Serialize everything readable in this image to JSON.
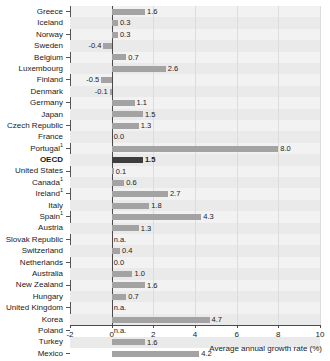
{
  "chart_data": {
    "type": "bar",
    "orientation": "horizontal",
    "title": "",
    "xlabel": "Average annual growth rate (%)",
    "ylabel": "",
    "xlim": [
      -2,
      10
    ],
    "xticks": [
      -2,
      0,
      2,
      4,
      6,
      8,
      10
    ],
    "xtick_labels": [
      "-2",
      "0",
      "2",
      "4",
      "6",
      "8",
      "10"
    ],
    "grid": true,
    "legend": false,
    "na_text": "n.a.",
    "categories": [
      "Greece",
      "Iceland",
      "Norway",
      "Sweden",
      "Belgium",
      "Luxembourg",
      "Finland",
      "Denmark",
      "Germany",
      "Japan",
      "Czech Republic",
      "France",
      "Portugal",
      "OECD",
      "United States",
      "Canada",
      "Ireland",
      "Italy",
      "Spain",
      "Austria",
      "Slovak Republic",
      "Switzerland",
      "Netherlands",
      "Australia",
      "New Zealand",
      "Hungary",
      "United Kingdom",
      "Korea",
      "Poland",
      "Turkey",
      "Mexico"
    ],
    "rows": [
      {
        "label": "Greece",
        "footnote": "",
        "value": 1.6,
        "display": "1.6",
        "na": false,
        "highlight": false
      },
      {
        "label": "Iceland",
        "footnote": "",
        "value": 0.3,
        "display": "0.3",
        "na": false,
        "highlight": false
      },
      {
        "label": "Norway",
        "footnote": "",
        "value": 0.3,
        "display": "0.3",
        "na": false,
        "highlight": false
      },
      {
        "label": "Sweden",
        "footnote": "",
        "value": -0.4,
        "display": "-0.4",
        "na": false,
        "highlight": false
      },
      {
        "label": "Belgium",
        "footnote": "",
        "value": 0.7,
        "display": "0.7",
        "na": false,
        "highlight": false
      },
      {
        "label": "Luxembourg",
        "footnote": "",
        "value": 2.6,
        "display": "2.6",
        "na": false,
        "highlight": false
      },
      {
        "label": "Finland",
        "footnote": "",
        "value": -0.5,
        "display": "-0.5",
        "na": false,
        "highlight": false
      },
      {
        "label": "Denmark",
        "footnote": "",
        "value": -0.1,
        "display": "-0.1",
        "na": false,
        "highlight": false
      },
      {
        "label": "Germany",
        "footnote": "",
        "value": 1.1,
        "display": "1.1",
        "na": false,
        "highlight": false
      },
      {
        "label": "Japan",
        "footnote": "",
        "value": 1.5,
        "display": "1.5",
        "na": false,
        "highlight": false
      },
      {
        "label": "Czech Republic",
        "footnote": "",
        "value": 1.3,
        "display": "1.3",
        "na": false,
        "highlight": false
      },
      {
        "label": "France",
        "footnote": "",
        "value": 0.0,
        "display": "0.0",
        "na": false,
        "highlight": false
      },
      {
        "label": "Portugal",
        "footnote": "1",
        "value": 8.0,
        "display": "8.0",
        "na": false,
        "highlight": false
      },
      {
        "label": "OECD",
        "footnote": "",
        "value": 1.5,
        "display": "1.5",
        "na": false,
        "highlight": true
      },
      {
        "label": "United States",
        "footnote": "",
        "value": 0.1,
        "display": "0.1",
        "na": false,
        "highlight": false
      },
      {
        "label": "Canada",
        "footnote": "1",
        "value": 0.6,
        "display": "0.6",
        "na": false,
        "highlight": false
      },
      {
        "label": "Ireland",
        "footnote": "1",
        "value": 2.7,
        "display": "2.7",
        "na": false,
        "highlight": false
      },
      {
        "label": "Italy",
        "footnote": "",
        "value": 1.8,
        "display": "1.8",
        "na": false,
        "highlight": false
      },
      {
        "label": "Spain",
        "footnote": "1",
        "value": 4.3,
        "display": "4.3",
        "na": false,
        "highlight": false
      },
      {
        "label": "Austria",
        "footnote": "",
        "value": 1.3,
        "display": "1.3",
        "na": false,
        "highlight": false
      },
      {
        "label": "Slovak Republic",
        "footnote": "",
        "value": null,
        "display": "n.a.",
        "na": true,
        "highlight": false
      },
      {
        "label": "Switzerland",
        "footnote": "",
        "value": 0.4,
        "display": "0.4",
        "na": false,
        "highlight": false
      },
      {
        "label": "Netherlands",
        "footnote": "",
        "value": 0.0,
        "display": "0.0",
        "na": false,
        "highlight": false
      },
      {
        "label": "Australia",
        "footnote": "",
        "value": 1.0,
        "display": "1.0",
        "na": false,
        "highlight": false
      },
      {
        "label": "New Zealand",
        "footnote": "",
        "value": 1.6,
        "display": "1.6",
        "na": false,
        "highlight": false
      },
      {
        "label": "Hungary",
        "footnote": "",
        "value": 0.7,
        "display": "0.7",
        "na": false,
        "highlight": false
      },
      {
        "label": "United Kingdom",
        "footnote": "",
        "value": null,
        "display": "n.a.",
        "na": true,
        "highlight": false
      },
      {
        "label": "Korea",
        "footnote": "",
        "value": 4.7,
        "display": "4.7",
        "na": false,
        "highlight": false
      },
      {
        "label": "Poland",
        "footnote": "",
        "value": null,
        "display": "n.a.",
        "na": true,
        "highlight": false
      },
      {
        "label": "Turkey",
        "footnote": "",
        "value": 1.6,
        "display": "1.6",
        "na": false,
        "highlight": false
      },
      {
        "label": "Mexico",
        "footnote": "",
        "value": 4.2,
        "display": "4.2",
        "na": false,
        "highlight": false
      }
    ],
    "colors": {
      "bar": "#a3a3a3",
      "bar_highlight": "#3d3d3d",
      "plot_background": "#f2f2f2",
      "band_alt": "#eaeaea",
      "axis": "#4a4a4a",
      "grid": "#dcdcdc",
      "text": "#1a1a1a"
    }
  }
}
